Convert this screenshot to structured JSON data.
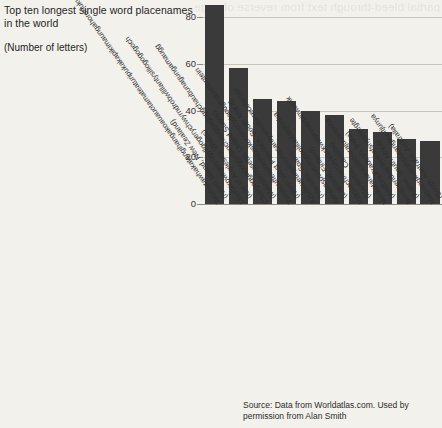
{
  "header": {
    "title": "Top ten longest single word placenames in the world",
    "subtitle": "(Number of letters)"
  },
  "source": {
    "text": "Source: Data from Worldatlas.com. Used by permission from Alan Smith"
  },
  "bleed": {
    "text": "partial bleed-through text from reverse of page"
  },
  "colors": {
    "bar": "#3a3a3a",
    "background": "#f3f1ec",
    "gridline": "#c9c6be",
    "axis": "#8d8a84"
  },
  "chart_data": {
    "type": "bar",
    "title": "Top ten longest single word placenames in the world",
    "subtitle": "(Number of letters)",
    "xlabel": "",
    "ylabel": "Number of letters",
    "ylim": [
      0,
      90
    ],
    "yticks": [
      0,
      20,
      40,
      60,
      80
    ],
    "grid": true,
    "legend": false,
    "orientation": "vertical",
    "categories": [
      "Taumatawhakatangihangakoauauotamateaturipukakapikimaungahoronukupokaiwhenuakitanatahu (North Island, New Zealand)",
      "Llanfairpwllgwyngyllgogerychwyrndrobwllllantysiliogogogoch (Isle of Anglesey, Wales)",
      "Chargoggagoggmanchauggagoggchaubunagungamaugg (Massachusetts, United States)",
      "Tweebuffelsmeteenskootmorsdoodgeskietfontein (North West Province, South Africa)",
      "Azpilicuetagaraycosaroyarenberecolarrea (Navarra, Spain)",
      "Aeniaespuuentspuolilaulasjionka (Lapland, Finland)",
      "Pekwachnamaykoskwaskwaypinwanik (Manitoba, Canada)",
      "Venkatanarasimharajuvaripeta (Andhra Pradesh, India)",
      "Bovenendvankeelafsnysleegte (Karoo, South Africa)",
      "Mamungkukumpurangkuntjunya (South Australia, Australia)"
    ],
    "labels_short": [
      {
        "place": "Taumatawhakatangihangakoauauotamateaturipukakapikimaungahoronukupokaiwhenuakitanatahu",
        "region": "(North Island, New Zealand)"
      },
      {
        "place": "Llanfairpwllgwyngyllgogerychwyrndrobwllllantysiliogogogoch",
        "region": "(Isle of Anglesey, Wales)"
      },
      {
        "place": "Chargoggagoggmanchauggagoggchaubunagungamaugg",
        "region": "(Massachusetts, United States)"
      },
      {
        "place": "Tweebuffelsmeteenskootmorsdoodgeskietfontein",
        "region": "(North West Province, South Africa)"
      },
      {
        "place": "Azpilicuetagaraycosaroyarenberecolarrea",
        "region": "(Navarra, Spain)"
      },
      {
        "place": "Aeniaespuuentspuolilaulasjionka",
        "region": "(Lapland, Finland)"
      },
      {
        "place": "Pekwachnamaykoskwaskwaypinwanik",
        "region": "(Manitoba, Canada)"
      },
      {
        "place": "Venkatanarasimharajuvaripeta",
        "region": "(Andhra Pradesh, India)"
      },
      {
        "place": "Bovenendvankeelafsnysleegte",
        "region": "(Karoo, South Africa)"
      },
      {
        "place": "Mamungkukumpurangkuntjunya",
        "region": "(South Australia, Australia)"
      }
    ],
    "values": [
      85,
      58,
      45,
      44,
      40,
      38,
      32,
      31,
      28,
      27
    ]
  }
}
